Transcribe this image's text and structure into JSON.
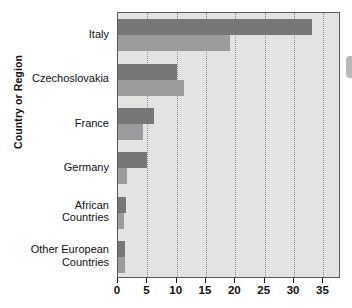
{
  "chart_data": {
    "type": "bar",
    "orientation": "horizontal",
    "title": "",
    "xlabel": "",
    "ylabel": "Country or Region",
    "categories": [
      "Italy",
      "Czechoslovakia",
      "France",
      "Germany",
      "African Countries",
      "Other European Countries"
    ],
    "category_lines": [
      [
        "Italy"
      ],
      [
        "Czechoslovakia"
      ],
      [
        "France"
      ],
      [
        "Germany"
      ],
      [
        "African",
        "Countries"
      ],
      [
        "Other European",
        "Countries"
      ]
    ],
    "series": [
      {
        "name": "series-a",
        "color": "#77777a",
        "values": [
          33.0,
          10.0,
          6.1,
          5.0,
          1.3,
          1.2
        ]
      },
      {
        "name": "series-b",
        "color": "#9b9b9d",
        "values": [
          19.0,
          11.3,
          4.2,
          1.6,
          1.0,
          1.2
        ]
      }
    ],
    "xlim": [
      0,
      38
    ],
    "xticks": [
      0,
      5,
      10,
      15,
      20,
      25,
      30,
      35
    ],
    "xtick_labels": [
      "0",
      "5",
      "10",
      "15",
      "20",
      "25",
      "30",
      "35"
    ],
    "grid": {
      "vertical": true,
      "style": "dotted",
      "horizontal": false
    },
    "legend": {
      "visible": false,
      "position": "none"
    },
    "plot_background": "#e3e3e1",
    "plot_border": "#5a5a5a"
  }
}
